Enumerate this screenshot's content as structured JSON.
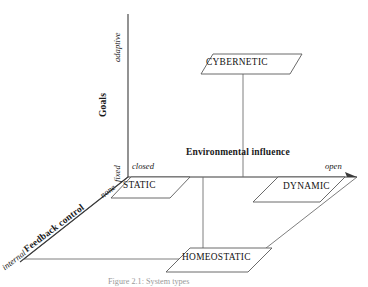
{
  "figure": {
    "caption": "Figure 2.1: System types"
  },
  "axes": {
    "vertical": {
      "name": "Goals",
      "low_label": "fixed",
      "high_label": "adaptive"
    },
    "horizontal": {
      "name": "Environmental influence",
      "low_label": "closed",
      "high_label": "open"
    },
    "depth": {
      "name": "Feedback control",
      "low_label": "none",
      "high_label": "internal"
    }
  },
  "nodes": [
    {
      "id": "cybernetic",
      "label": "CYBERNETIC"
    },
    {
      "id": "static",
      "label": "STATIC"
    },
    {
      "id": "dynamic",
      "label": "DYNAMIC"
    },
    {
      "id": "homeostatic",
      "label": "HOMEOSTATIC"
    }
  ],
  "colors": {
    "axis": "#3a3a3a",
    "plane": "#6f6f6f",
    "box_stroke": "#5a5a5a",
    "text": "#1a1a1a",
    "caption": "#9a9a9a",
    "background": "#ffffff"
  }
}
